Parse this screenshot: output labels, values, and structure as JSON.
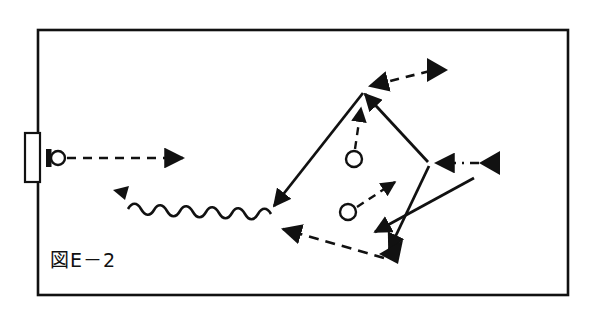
{
  "figure": {
    "caption": "図E－2",
    "caption_parts": {
      "boxed_char": "図",
      "letter": "E",
      "dash": "－",
      "number": "2"
    },
    "line_color": "#111111",
    "background_color": "#ffffff",
    "frame": {
      "x": 38,
      "y": 30,
      "width": 530,
      "height": 265,
      "stroke_width": 2.6
    },
    "left_tab": {
      "x": 25,
      "y": 133,
      "width": 15,
      "height": 49,
      "stroke_width": 2.2
    },
    "source_marker": {
      "bar_x": 47,
      "bar_y": 150,
      "bar_width": 5,
      "bar_height": 17,
      "circle_cx": 58,
      "circle_cy": 158,
      "circle_r": 7
    },
    "interior_circles": [
      {
        "cx": 354,
        "cy": 159,
        "r": 8
      },
      {
        "cx": 348,
        "cy": 212,
        "r": 8
      }
    ],
    "quadrilateral_vertices": {
      "top": {
        "x": 363,
        "y": 91
      },
      "right": {
        "x": 429,
        "y": 163
      },
      "bottom": {
        "x": 387,
        "y": 259
      },
      "left": {
        "x": 272,
        "y": 208
      }
    },
    "edges": [
      {
        "name": "top-left-edge",
        "style": "solid",
        "from": "top",
        "to": "left",
        "arrow_at": "left"
      },
      {
        "name": "top-right-edge",
        "style": "solid",
        "from": "right",
        "to": "top",
        "arrow_at": "top"
      },
      {
        "name": "bottom-right-edge",
        "style": "solid",
        "from": "right",
        "to": "bottom",
        "arrow_at": "bottom"
      },
      {
        "name": "bottom-left-edge",
        "style": "dashed",
        "from": "bottom",
        "to": "left",
        "arrow_at": "left"
      }
    ],
    "incoming_arrows": [
      {
        "name": "source-beam",
        "style": "dashed",
        "x1": 66,
        "y1": 158,
        "x2": 186,
        "y2": 158
      },
      {
        "name": "top-incoming",
        "style": "dashed",
        "x1": 433,
        "y1": 70,
        "x2": 369,
        "y2": 87
      },
      {
        "name": "right-incoming",
        "style": "dash-dot",
        "x1": 486,
        "y1": 163,
        "x2": 434,
        "y2": 163
      },
      {
        "name": "bottom-incoming",
        "style": "solid",
        "x1": 472,
        "y1": 180,
        "x2": 372,
        "y2": 234
      }
    ],
    "internal_arrows": [
      {
        "name": "upper-circle-emission",
        "style": "dashed",
        "x1": 354,
        "y1": 148,
        "x2": 360,
        "y2": 104
      },
      {
        "name": "lower-circle-emission",
        "style": "dashed",
        "x1": 357,
        "y1": 208,
        "x2": 398,
        "y2": 180
      }
    ],
    "wavy_arrow": {
      "name": "wave-emission",
      "start_x": 270,
      "start_y": 215,
      "end_x": 120,
      "end_y": 192,
      "amplitude": 7,
      "wavelength": 19
    },
    "large_arrowheads": [
      {
        "name": "top-right-incoming-head",
        "x": 437,
        "y": 69,
        "angle": 195
      },
      {
        "name": "right-incoming-head",
        "x": 490,
        "y": 163,
        "angle": 180
      },
      {
        "name": "bottom-vertex-head",
        "x": 392,
        "y": 247,
        "angle": 215
      }
    ]
  }
}
